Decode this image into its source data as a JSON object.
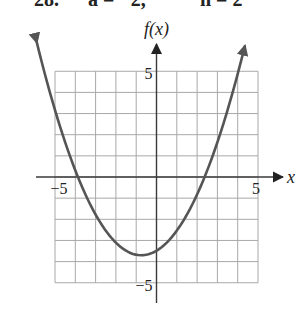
{
  "header": {
    "problem_number": "28.",
    "param_a": "a = −2,",
    "param_h": "h = 2"
  },
  "chart_data": {
    "type": "line",
    "title": "",
    "xlabel": "x",
    "ylabel": "f(x)",
    "xlim": [
      -5,
      5
    ],
    "ylim": [
      -5,
      5
    ],
    "grid": true,
    "grid_step": 1,
    "x_tick_labels": [
      {
        "value": -5,
        "label": "−5"
      },
      {
        "value": 5,
        "label": "5"
      }
    ],
    "y_tick_labels": [
      {
        "value": 5,
        "label": "5"
      },
      {
        "value": -5,
        "label": "−5"
      }
    ],
    "series": [
      {
        "name": "f(x)",
        "kind": "parabola",
        "vertex": [
          -0.75,
          -3.7
        ],
        "a": 0.38,
        "x_range": [
          -5.9,
          4.35
        ],
        "roots": [
          -3.87,
          2.37
        ],
        "y_intercept": -3.49,
        "arrows_at_ends": true,
        "color": "#555555"
      }
    ],
    "colors": {
      "grid": "#a8a8a8",
      "axes": "#3a3a3a",
      "curve": "#555555"
    }
  }
}
